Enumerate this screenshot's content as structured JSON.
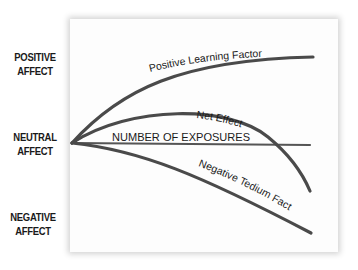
{
  "y_axis": {
    "positive_line1": "POSITIVE",
    "positive_line2": "AFFECT",
    "neutral_line1": "NEUTRAL",
    "neutral_line2": "AFFECT",
    "negative_line1": "NEGATIVE",
    "negative_line2": "AFFECT"
  },
  "x_axis": {
    "label": "NUMBER OF EXPOSURES"
  },
  "curves": {
    "positive": "Positive Learning Factor",
    "net": "Net Effect",
    "negative": "Negative Tedium Factor"
  },
  "colors": {
    "line": "#4a4a4a",
    "panel": "#fdfdfd",
    "text": "#1a1a1a"
  }
}
